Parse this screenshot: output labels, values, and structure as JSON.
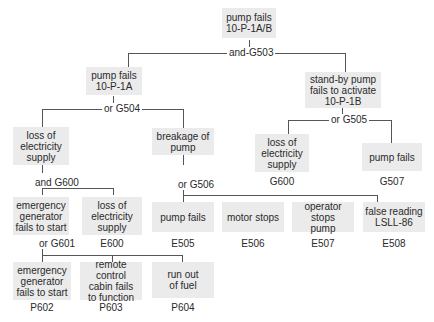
{
  "diagram": {
    "type": "fault-tree",
    "top_event": {
      "label": "pump fails\n10-P-1A/B"
    },
    "gates": {
      "g503": "and-G503",
      "g504": "or  G504",
      "g505": "or  G505",
      "g600": "and  G600",
      "g506": "or  G506",
      "g601": "or  G601"
    },
    "nodes": {
      "pump_fails_1a": {
        "label": "pump fails\n10-P-1A"
      },
      "standby_fails": {
        "label": "stand-by pump\nfails to activate\n10-P-1B"
      },
      "loss_elec_g600_right": {
        "label": "loss of\nelectricity\nsupply",
        "code": "G600"
      },
      "pump_fails_g507": {
        "label": "pump fails",
        "code": "G507"
      },
      "loss_elec_left": {
        "label": "loss of\nelectricity\nsupply"
      },
      "breakage": {
        "label": "breakage of\npump"
      },
      "emerg_gen_fails": {
        "label": "emergency\ngenerator\nfails to start"
      },
      "loss_elec_e600": {
        "label": "loss of\nelectricity\nsupply",
        "code": "E600"
      },
      "pump_fails_e505": {
        "label": "pump fails",
        "code": "E505"
      },
      "motor_stops": {
        "label": "motor stops",
        "code": "E506"
      },
      "operator_stops": {
        "label": "operator\nstops\npump",
        "code": "E507"
      },
      "false_reading": {
        "label": "false reading\nLSLL-86",
        "code": "E508"
      },
      "emerg_gen_p602": {
        "label": "emergency\ngenerator\nfails to start",
        "code": "P602"
      },
      "remote_control": {
        "label": "remote control\ncabin fails\nto function",
        "code": "P603"
      },
      "run_out_fuel": {
        "label": "run out\nof fuel",
        "code": "P604"
      }
    }
  }
}
